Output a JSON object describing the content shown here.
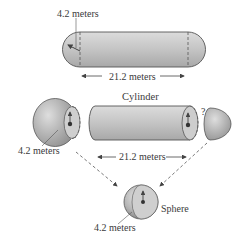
{
  "figure": {
    "top": {
      "radius_label": "4.2 meters",
      "length_label": "21.2 meters"
    },
    "middle": {
      "cylinder_title": "Cylinder",
      "left_cap_radius_label": "4.2 meters",
      "length_label": "21.2 meters",
      "question_mark": "?"
    },
    "bottom": {
      "sphere_title": "Sphere",
      "sphere_radius_label": "4.2 meters"
    }
  },
  "colors": {
    "fill_light": "#d6d6d6",
    "fill_mid": "#b8b8b8",
    "fill_dark": "#8e8e8e",
    "stroke": "#555555",
    "text": "#3a3a3a"
  }
}
